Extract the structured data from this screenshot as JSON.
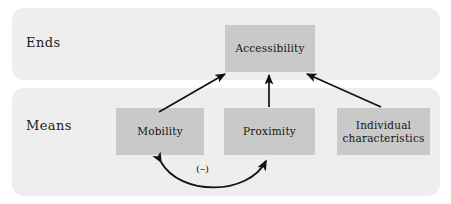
{
  "figure": {
    "background_color": "#ffffff",
    "band_color": "#eeeeee",
    "node_color": "#c9c9c9",
    "arrow_color": "#111111"
  },
  "bands": [
    {
      "id": "ends",
      "label": "Ends"
    },
    {
      "id": "means",
      "label": "Means"
    }
  ],
  "nodes": [
    {
      "id": "accessibility",
      "label": "Accessibility",
      "band": "ends"
    },
    {
      "id": "mobility",
      "label": "Mobility",
      "band": "means"
    },
    {
      "id": "proximity",
      "label": "Proximity",
      "band": "means"
    },
    {
      "id": "individual",
      "label": "Individual\ncharacteristics",
      "line1": "Individual",
      "line2": "characteristics",
      "band": "means"
    }
  ],
  "edges": [
    {
      "id": "mobility-to-accessibility",
      "from": "mobility",
      "to": "accessibility",
      "style": "straight-arrow",
      "heads": "one"
    },
    {
      "id": "proximity-to-accessibility",
      "from": "proximity",
      "to": "accessibility",
      "style": "straight-arrow",
      "heads": "one"
    },
    {
      "id": "individual-to-accessibility",
      "from": "individual",
      "to": "accessibility",
      "style": "straight-arrow",
      "heads": "one"
    },
    {
      "id": "mobility-proximity-tradeoff",
      "from": "mobility",
      "to": "proximity",
      "style": "curved-arrow",
      "heads": "two",
      "label": "(–)"
    }
  ],
  "annotations": {
    "tradeoff_sign": "(–)"
  }
}
